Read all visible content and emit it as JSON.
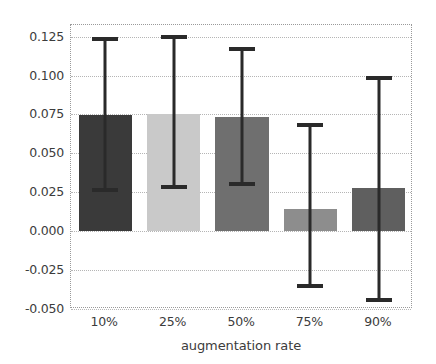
{
  "chart_data": {
    "type": "bar",
    "title": "",
    "xlabel": "augmentation rate",
    "ylabel": "",
    "categories": [
      "10%",
      "25%",
      "50%",
      "75%",
      "90%"
    ],
    "values": [
      0.0744,
      0.0752,
      0.0735,
      0.0144,
      0.0277
    ],
    "error_low": [
      0.0262,
      0.0281,
      0.0305,
      -0.035,
      -0.0444
    ],
    "error_high": [
      0.1235,
      0.125,
      0.1168,
      0.0683,
      0.0985
    ],
    "bar_colors": [
      "#3a3a3a",
      "#c9c9c9",
      "#6f6f6f",
      "#8d8d8d",
      "#5f5f5f"
    ],
    "ylim": [
      -0.05,
      0.1325
    ],
    "yticks": [
      0.125,
      0.1,
      0.075,
      0.05,
      0.025,
      0.0,
      -0.025,
      -0.05
    ],
    "ytick_labels": [
      "0.125",
      "0.100",
      "0.075",
      "0.050",
      "0.025",
      "0.000",
      "-0.025",
      "-0.050"
    ],
    "grid": true,
    "grid_color": "#b5b5b5",
    "legend": null,
    "errorbar_color": "#2a2a2a",
    "background": "#ffffff"
  }
}
